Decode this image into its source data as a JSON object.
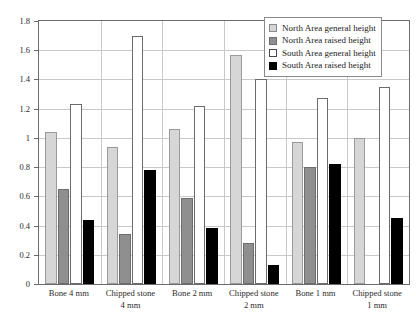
{
  "chart_data": {
    "type": "bar",
    "title": "",
    "subtitle": "",
    "xlabel": "",
    "ylabel": "",
    "ylim": [
      0,
      1.8
    ],
    "yticks": [
      0,
      0.2,
      0.4,
      0.6,
      0.8,
      1,
      1.2,
      1.4,
      1.6,
      1.8
    ],
    "ytick_labels": [
      "0",
      "0.2",
      "0.4",
      "0.6",
      "0.8",
      "1",
      "1.2",
      "1.4",
      "1.6",
      "1.8"
    ],
    "grid": true,
    "legend_position": "top-right",
    "categories": [
      "Bone 4 mm",
      "Chipped stone 4 mm",
      "Bone 2 mm",
      "Chipped stone 2 mm",
      "Bone 1 mm",
      "Chipped stone 1 mm"
    ],
    "category_lines": [
      [
        "Bone 4 mm"
      ],
      [
        "Chipped stone",
        "4 mm"
      ],
      [
        "Bone 2 mm"
      ],
      [
        "Chipped stone",
        "2 mm"
      ],
      [
        "Bone 1 mm"
      ],
      [
        "Chipped stone",
        "1 mm"
      ]
    ],
    "series": [
      {
        "name": "North Area general height",
        "color": "#d6d6d6",
        "values": [
          1.04,
          0.94,
          1.06,
          1.57,
          0.97,
          1.0
        ]
      },
      {
        "name": "North Area raised height",
        "color": "#8f8f8f",
        "values": [
          0.65,
          0.34,
          0.59,
          0.28,
          0.8,
          0.0
        ]
      },
      {
        "name": "South Area general height",
        "color": "#ffffff",
        "values": [
          1.23,
          1.7,
          1.22,
          1.4,
          1.27,
          1.35
        ]
      },
      {
        "name": "South Area raised height",
        "color": "#000000",
        "values": [
          0.44,
          0.78,
          0.38,
          0.13,
          0.82,
          0.45
        ]
      }
    ]
  },
  "legend": {
    "items": [
      "North Area general height",
      "North Area raised height",
      "South Area general height",
      "South Area raised height"
    ]
  }
}
